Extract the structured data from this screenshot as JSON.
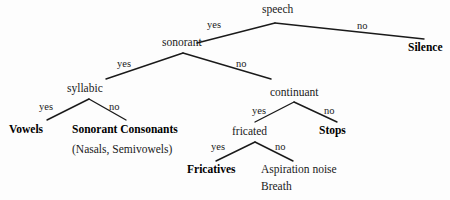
{
  "diagram": {
    "type": "decision-tree",
    "background_color": "#fdfdfd",
    "line_color": "#1a1a1a",
    "text_color": "#000000",
    "nodes": [
      {
        "id": "speech",
        "label": "speech",
        "kind": "internal",
        "x": 262,
        "y": 4
      },
      {
        "id": "sonorant",
        "label": "sonorant",
        "kind": "internal",
        "x": 162,
        "y": 37
      },
      {
        "id": "silence",
        "label": "Silence",
        "kind": "leaf",
        "x": 408,
        "y": 42
      },
      {
        "id": "syllabic",
        "label": "syllabic",
        "kind": "internal",
        "x": 67,
        "y": 83
      },
      {
        "id": "continuant",
        "label": "continuant",
        "kind": "internal",
        "x": 270,
        "y": 87
      },
      {
        "id": "vowels",
        "label": "Vowels",
        "kind": "leaf",
        "x": 9,
        "y": 124
      },
      {
        "id": "soncons",
        "label": "Sonorant Consonants",
        "kind": "leaf",
        "x": 72,
        "y": 124
      },
      {
        "id": "sonconssub",
        "label": "(Nasals, Semivowels)",
        "kind": "sub",
        "x": 72,
        "y": 144
      },
      {
        "id": "fricated",
        "label": "fricated",
        "kind": "internal",
        "x": 232,
        "y": 126
      },
      {
        "id": "stops",
        "label": "Stops",
        "kind": "leaf",
        "x": 319,
        "y": 125
      },
      {
        "id": "fricatives",
        "label": "Fricatives",
        "kind": "leaf",
        "x": 187,
        "y": 164
      },
      {
        "id": "aspiration",
        "label": "Aspiration noise",
        "kind": "plain",
        "x": 261,
        "y": 164
      },
      {
        "id": "breath",
        "label": "Breath",
        "kind": "plain",
        "x": 261,
        "y": 181
      }
    ],
    "edges": [
      {
        "from": "speech",
        "to": "sonorant",
        "branch": "yes",
        "x1": 275,
        "y1": 23,
        "x2": 197,
        "y2": 43,
        "lx": 207,
        "ly": 20
      },
      {
        "from": "speech",
        "to": "silence",
        "branch": "no",
        "x1": 275,
        "y1": 23,
        "x2": 424,
        "y2": 39,
        "lx": 357,
        "ly": 21
      },
      {
        "from": "sonorant",
        "to": "syllabic",
        "branch": "yes",
        "x1": 183,
        "y1": 53,
        "x2": 106,
        "y2": 79,
        "lx": 117,
        "ly": 59
      },
      {
        "from": "sonorant",
        "to": "continuant",
        "branch": "no",
        "x1": 183,
        "y1": 53,
        "x2": 271,
        "y2": 79,
        "lx": 236,
        "ly": 59
      },
      {
        "from": "syllabic",
        "to": "vowels",
        "branch": "yes",
        "x1": 89,
        "y1": 99,
        "x2": 47,
        "y2": 120,
        "lx": 39,
        "ly": 102
      },
      {
        "from": "syllabic",
        "to": "soncons",
        "branch": "no",
        "x1": 89,
        "y1": 99,
        "x2": 126,
        "y2": 120,
        "lx": 109,
        "ly": 102
      },
      {
        "from": "continuant",
        "to": "fricated",
        "branch": "yes",
        "x1": 294,
        "y1": 102,
        "x2": 255,
        "y2": 122,
        "lx": 252,
        "ly": 106
      },
      {
        "from": "continuant",
        "to": "stops",
        "branch": "no",
        "x1": 294,
        "y1": 102,
        "x2": 337,
        "y2": 122,
        "lx": 324,
        "ly": 106
      },
      {
        "from": "fricated",
        "to": "fricatives",
        "branch": "yes",
        "x1": 255,
        "y1": 142,
        "x2": 216,
        "y2": 161,
        "lx": 211,
        "ly": 142
      },
      {
        "from": "fricated",
        "to": "aspiration",
        "branch": "no",
        "x1": 255,
        "y1": 142,
        "x2": 293,
        "y2": 161,
        "lx": 275,
        "ly": 142
      }
    ]
  }
}
